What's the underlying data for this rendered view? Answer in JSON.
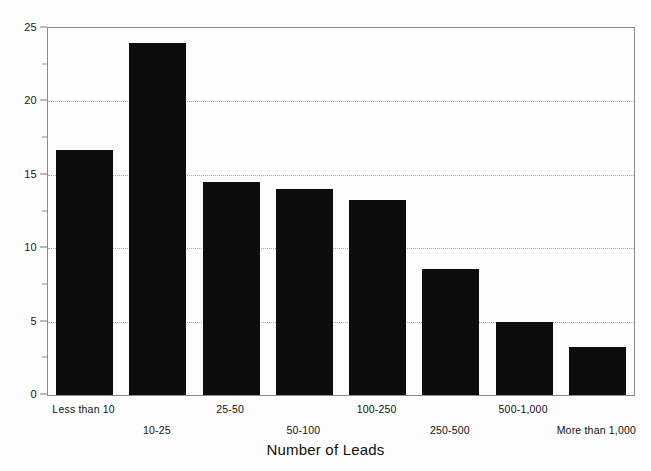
{
  "chart_data": {
    "type": "bar",
    "title": "",
    "xlabel": "Number of Leads",
    "ylabel": "",
    "categories": [
      "Less than 10",
      "10-25",
      "25-50",
      "50-100",
      "100-250",
      "250-500",
      "500-1,000",
      "More than 1,000"
    ],
    "values": [
      16.7,
      24.0,
      14.5,
      14.0,
      13.3,
      8.6,
      5.0,
      3.3
    ],
    "ylim": [
      0,
      25
    ],
    "yticks": [
      0,
      5,
      10,
      15,
      20,
      25
    ],
    "ytick_labels": [
      "0",
      "5",
      "10",
      "15",
      "20",
      "25"
    ],
    "yminor_ticks": [
      2.5,
      7.5,
      12.5,
      17.5,
      22.5
    ],
    "grid": "horizontal-dotted",
    "legend": "none",
    "bar_color": "#0d0d0d",
    "grid_color": "#a8a8a8",
    "axis_color": "#8a8a8a",
    "background": "#fdfdfd",
    "label_stagger": [
      "top",
      "bottom",
      "top",
      "bottom",
      "top",
      "bottom",
      "top",
      "bottom"
    ]
  }
}
